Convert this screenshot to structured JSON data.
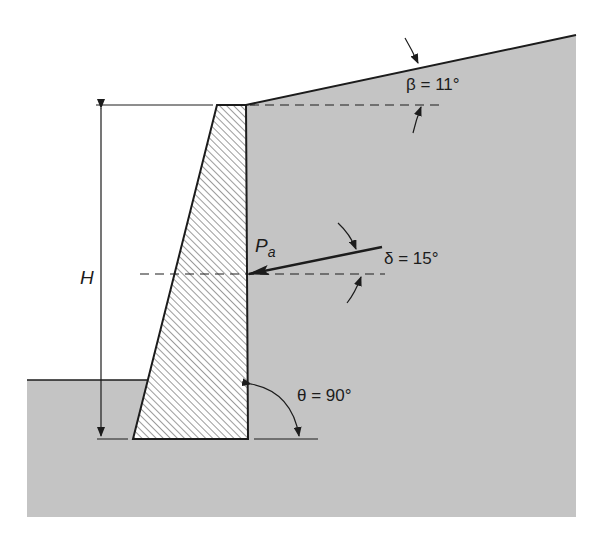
{
  "diagram": {
    "type": "retaining-wall-earth-pressure",
    "colors": {
      "soil_fill": "#c4c4c4",
      "line": "#1c1c1c",
      "background": "#ffffff",
      "hatch": "#3a3a3a"
    },
    "labels": {
      "height": "H",
      "active_force_main": "P",
      "active_force_sub": "a",
      "backfill_slope": "β = 11°",
      "wall_friction": "δ = 15°",
      "wall_back_angle": "θ = 90°"
    },
    "parameters": {
      "beta_deg": 11,
      "delta_deg": 15,
      "theta_deg": 90
    }
  }
}
